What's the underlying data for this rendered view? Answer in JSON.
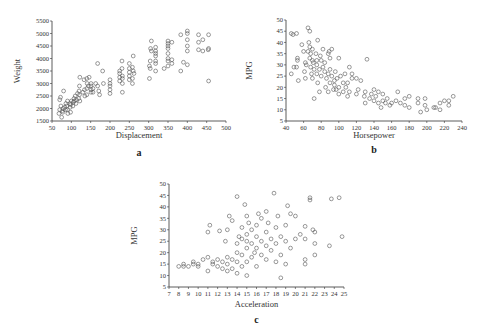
{
  "figure": {
    "panels": [
      "a",
      "b",
      "c"
    ]
  },
  "chart_data": [
    {
      "id": "a",
      "type": "scatter",
      "title": "",
      "xlabel": "Displacement",
      "ylabel": "Weight",
      "panel_label": "a",
      "xlim": [
        50,
        500
      ],
      "ylim": [
        1500,
        5500
      ],
      "xticks": [
        50,
        100,
        150,
        200,
        250,
        300,
        350,
        400,
        450,
        500
      ],
      "yticks": [
        1500,
        2000,
        2500,
        3000,
        3500,
        4000,
        4500,
        5000,
        5500
      ],
      "grid": false,
      "marker": "open-circle",
      "points": [
        [
          68,
          1800
        ],
        [
          70,
          1950
        ],
        [
          70,
          2350
        ],
        [
          72,
          2450
        ],
        [
          73,
          2100
        ],
        [
          75,
          1650
        ],
        [
          76,
          1900
        ],
        [
          78,
          1850
        ],
        [
          79,
          2000
        ],
        [
          80,
          2700
        ],
        [
          83,
          2050
        ],
        [
          85,
          1950
        ],
        [
          86,
          2200
        ],
        [
          88,
          2100
        ],
        [
          90,
          1950
        ],
        [
          90,
          2300
        ],
        [
          91,
          1800
        ],
        [
          97,
          2050
        ],
        [
          97,
          2200
        ],
        [
          98,
          2150
        ],
        [
          98,
          1850
        ],
        [
          100,
          2300
        ],
        [
          104,
          2100
        ],
        [
          105,
          2250
        ],
        [
          107,
          2400
        ],
        [
          108,
          2300
        ],
        [
          110,
          2500
        ],
        [
          112,
          2200
        ],
        [
          113,
          2350
        ],
        [
          116,
          2600
        ],
        [
          119,
          2400
        ],
        [
          120,
          2700
        ],
        [
          121,
          2550
        ],
        [
          121,
          2900
        ],
        [
          122,
          3250
        ],
        [
          122,
          2300
        ],
        [
          130,
          2650
        ],
        [
          133,
          3150
        ],
        [
          134,
          2750
        ],
        [
          135,
          2500
        ],
        [
          140,
          2800
        ],
        [
          140,
          2550
        ],
        [
          140,
          3200
        ],
        [
          141,
          3000
        ],
        [
          144,
          2900
        ],
        [
          146,
          3250
        ],
        [
          151,
          2650
        ],
        [
          151,
          2900
        ],
        [
          151,
          3000
        ],
        [
          151,
          2750
        ],
        [
          156,
          2800
        ],
        [
          156,
          2650
        ],
        [
          163,
          3000
        ],
        [
          168,
          2900
        ],
        [
          168,
          3800
        ],
        [
          171,
          2700
        ],
        [
          173,
          2550
        ],
        [
          181,
          3500
        ],
        [
          183,
          3000
        ],
        [
          200,
          2600
        ],
        [
          200,
          2900
        ],
        [
          200,
          3150
        ],
        [
          200,
          3000
        ],
        [
          200,
          2750
        ],
        [
          225,
          3400
        ],
        [
          225,
          3250
        ],
        [
          225,
          3500
        ],
        [
          225,
          3100
        ],
        [
          231,
          3600
        ],
        [
          231,
          3900
        ],
        [
          232,
          2650
        ],
        [
          232,
          3000
        ],
        [
          232,
          3300
        ],
        [
          232,
          3200
        ],
        [
          250,
          3300
        ],
        [
          250,
          3600
        ],
        [
          250,
          3150
        ],
        [
          250,
          3800
        ],
        [
          250,
          3450
        ],
        [
          258,
          3200
        ],
        [
          258,
          3650
        ],
        [
          258,
          3000
        ],
        [
          260,
          3500
        ],
        [
          260,
          4100
        ],
        [
          262,
          3400
        ],
        [
          302,
          3200
        ],
        [
          302,
          3700
        ],
        [
          304,
          3600
        ],
        [
          304,
          3900
        ],
        [
          305,
          4400
        ],
        [
          307,
          4300
        ],
        [
          307,
          4700
        ],
        [
          318,
          3900
        ],
        [
          318,
          4100
        ],
        [
          318,
          4200
        ],
        [
          318,
          3500
        ],
        [
          318,
          3800
        ],
        [
          318,
          4300
        ],
        [
          318,
          4450
        ],
        [
          340,
          3600
        ],
        [
          350,
          3700
        ],
        [
          350,
          4000
        ],
        [
          350,
          4200
        ],
        [
          350,
          4400
        ],
        [
          350,
          4500
        ],
        [
          350,
          4600
        ],
        [
          350,
          4700
        ],
        [
          350,
          3900
        ],
        [
          360,
          3800
        ],
        [
          360,
          3950
        ],
        [
          360,
          4650
        ],
        [
          383,
          3500
        ],
        [
          383,
          4950
        ],
        [
          390,
          3850
        ],
        [
          400,
          4300
        ],
        [
          400,
          4500
        ],
        [
          400,
          4750
        ],
        [
          400,
          5000
        ],
        [
          400,
          5100
        ],
        [
          400,
          3750
        ],
        [
          429,
          4350
        ],
        [
          429,
          4650
        ],
        [
          429,
          4950
        ],
        [
          440,
          4300
        ],
        [
          440,
          4750
        ],
        [
          454,
          4350
        ],
        [
          455,
          4400
        ],
        [
          455,
          4950
        ],
        [
          455,
          3100
        ]
      ]
    },
    {
      "id": "b",
      "type": "scatter",
      "title": "",
      "xlabel": "Horsepower",
      "ylabel": "MPG",
      "panel_label": "b",
      "xlim": [
        40,
        240
      ],
      "ylim": [
        5,
        50
      ],
      "xticks": [
        40,
        60,
        80,
        100,
        120,
        140,
        160,
        180,
        200,
        220,
        240
      ],
      "yticks": [
        5,
        10,
        15,
        20,
        25,
        30,
        35,
        40,
        45,
        50
      ],
      "grid": false,
      "marker": "open-circle",
      "points": [
        [
          46,
          26
        ],
        [
          46,
          44
        ],
        [
          48,
          43.5
        ],
        [
          49,
          29
        ],
        [
          52,
          29
        ],
        [
          52,
          44
        ],
        [
          53,
          32
        ],
        [
          53,
          33
        ],
        [
          54,
          23
        ],
        [
          58,
          39
        ],
        [
          60,
          36
        ],
        [
          61,
          27
        ],
        [
          62,
          24
        ],
        [
          62,
          31
        ],
        [
          63,
          30
        ],
        [
          65,
          46.5
        ],
        [
          65,
          36
        ],
        [
          66,
          40
        ],
        [
          67,
          45
        ],
        [
          67,
          33
        ],
        [
          67,
          38
        ],
        [
          68,
          29
        ],
        [
          68,
          35
        ],
        [
          69,
          26
        ],
        [
          70,
          32
        ],
        [
          70,
          37
        ],
        [
          70,
          24
        ],
        [
          71,
          31
        ],
        [
          72,
          15
        ],
        [
          72,
          28
        ],
        [
          74,
          35
        ],
        [
          75,
          26
        ],
        [
          75,
          30
        ],
        [
          75,
          32
        ],
        [
          76,
          41
        ],
        [
          76,
          22
        ],
        [
          78,
          18
        ],
        [
          78,
          28
        ],
        [
          79,
          34
        ],
        [
          80,
          25
        ],
        [
          80,
          32
        ],
        [
          82,
          29
        ],
        [
          82,
          37
        ],
        [
          84,
          27
        ],
        [
          84,
          31
        ],
        [
          85,
          20
        ],
        [
          86,
          24
        ],
        [
          88,
          18
        ],
        [
          88,
          26
        ],
        [
          88,
          35
        ],
        [
          89,
          36
        ],
        [
          90,
          22
        ],
        [
          90,
          28
        ],
        [
          90,
          33
        ],
        [
          92,
          25
        ],
        [
          92,
          37
        ],
        [
          94,
          19
        ],
        [
          95,
          21
        ],
        [
          95,
          23
        ],
        [
          96,
          27
        ],
        [
          97,
          19
        ],
        [
          98,
          24
        ],
        [
          100,
          17
        ],
        [
          100,
          20
        ],
        [
          100,
          33
        ],
        [
          102,
          25
        ],
        [
          105,
          18
        ],
        [
          105,
          22
        ],
        [
          107,
          26
        ],
        [
          108,
          20
        ],
        [
          110,
          16
        ],
        [
          110,
          22
        ],
        [
          112,
          18
        ],
        [
          112,
          29
        ],
        [
          115,
          24
        ],
        [
          115,
          26
        ],
        [
          120,
          17
        ],
        [
          120,
          24
        ],
        [
          122,
          19
        ],
        [
          125,
          23
        ],
        [
          129,
          16
        ],
        [
          130,
          13
        ],
        [
          130,
          18
        ],
        [
          132,
          32.5
        ],
        [
          135,
          15
        ],
        [
          137,
          17
        ],
        [
          140,
          14
        ],
        [
          140,
          19
        ],
        [
          142,
          16
        ],
        [
          145,
          13
        ],
        [
          145,
          18
        ],
        [
          148,
          11
        ],
        [
          150,
          14
        ],
        [
          150,
          17
        ],
        [
          153,
          13
        ],
        [
          155,
          15
        ],
        [
          158,
          12
        ],
        [
          160,
          13
        ],
        [
          165,
          14
        ],
        [
          167,
          18
        ],
        [
          170,
          13
        ],
        [
          175,
          12
        ],
        [
          175,
          15
        ],
        [
          180,
          11
        ],
        [
          180,
          16
        ],
        [
          190,
          13
        ],
        [
          190,
          15
        ],
        [
          193,
          9
        ],
        [
          198,
          12
        ],
        [
          198,
          15
        ],
        [
          200,
          10
        ],
        [
          208,
          11
        ],
        [
          210,
          11
        ],
        [
          215,
          10
        ],
        [
          215,
          13
        ],
        [
          220,
          14
        ],
        [
          225,
          12
        ],
        [
          225,
          14
        ],
        [
          230,
          16
        ]
      ]
    },
    {
      "id": "c",
      "type": "scatter",
      "title": "",
      "xlabel": "Acceleration",
      "ylabel": "MPG",
      "panel_label": "c",
      "xlim": [
        7,
        25
      ],
      "ylim": [
        5,
        50
      ],
      "xticks": [
        7,
        8,
        9,
        10,
        11,
        12,
        13,
        14,
        15,
        16,
        17,
        18,
        19,
        20,
        21,
        22,
        23,
        24,
        25
      ],
      "yticks": [
        5,
        10,
        15,
        20,
        25,
        30,
        35,
        40,
        45,
        50
      ],
      "grid": false,
      "marker": "open-circle",
      "points": [
        [
          8,
          14
        ],
        [
          8.5,
          14
        ],
        [
          8.5,
          15
        ],
        [
          9,
          14
        ],
        [
          9.5,
          15
        ],
        [
          9.5,
          16
        ],
        [
          10,
          14
        ],
        [
          10,
          15
        ],
        [
          10.5,
          17
        ],
        [
          11,
          12
        ],
        [
          11,
          18
        ],
        [
          11,
          29
        ],
        [
          11.2,
          32
        ],
        [
          11.5,
          15
        ],
        [
          11.5,
          16
        ],
        [
          12,
          14
        ],
        [
          12,
          17
        ],
        [
          12.2,
          29.5
        ],
        [
          12.5,
          13
        ],
        [
          12.5,
          16
        ],
        [
          12.8,
          25
        ],
        [
          13,
          12
        ],
        [
          13,
          15
        ],
        [
          13,
          18
        ],
        [
          13,
          30
        ],
        [
          13.2,
          36
        ],
        [
          13.5,
          13
        ],
        [
          13.5,
          17
        ],
        [
          13.5,
          34
        ],
        [
          14,
          11
        ],
        [
          14,
          16
        ],
        [
          14,
          20
        ],
        [
          14,
          24
        ],
        [
          14,
          44.5
        ],
        [
          14.2,
          27
        ],
        [
          14.5,
          14
        ],
        [
          14.5,
          19
        ],
        [
          14.5,
          26
        ],
        [
          14.5,
          31
        ],
        [
          14.8,
          41
        ],
        [
          15,
          10
        ],
        [
          15,
          16
        ],
        [
          15,
          22
        ],
        [
          15,
          25
        ],
        [
          15,
          28
        ],
        [
          15,
          36
        ],
        [
          15.2,
          33
        ],
        [
          15.5,
          18
        ],
        [
          15.5,
          24
        ],
        [
          15.5,
          30
        ],
        [
          15.8,
          20
        ],
        [
          16,
          14
        ],
        [
          16,
          22
        ],
        [
          16,
          27
        ],
        [
          16,
          32
        ],
        [
          16.2,
          37
        ],
        [
          16.5,
          19
        ],
        [
          16.5,
          25
        ],
        [
          16.5,
          35
        ],
        [
          17,
          17
        ],
        [
          17,
          23
        ],
        [
          17,
          29
        ],
        [
          17,
          38
        ],
        [
          17.2,
          33
        ],
        [
          17.5,
          21
        ],
        [
          17.5,
          26
        ],
        [
          17.8,
          46
        ],
        [
          18,
          16
        ],
        [
          18,
          24
        ],
        [
          18,
          31
        ],
        [
          18.2,
          36
        ],
        [
          18.5,
          9
        ],
        [
          18.5,
          19
        ],
        [
          18.5,
          27
        ],
        [
          19,
          15
        ],
        [
          19,
          25
        ],
        [
          19,
          32
        ],
        [
          19.2,
          40.5
        ],
        [
          19.5,
          37
        ],
        [
          19.5,
          22
        ],
        [
          20,
          26
        ],
        [
          20,
          36
        ],
        [
          20.5,
          28
        ],
        [
          21,
          15
        ],
        [
          21,
          17
        ],
        [
          21,
          26
        ],
        [
          21,
          31.5
        ],
        [
          21.5,
          43
        ],
        [
          21.5,
          44
        ],
        [
          21.8,
          30
        ],
        [
          22,
          19
        ],
        [
          22,
          24
        ],
        [
          22,
          29
        ],
        [
          23.5,
          23
        ],
        [
          23.7,
          43.5
        ],
        [
          24.5,
          44
        ],
        [
          24.8,
          27
        ]
      ]
    }
  ]
}
